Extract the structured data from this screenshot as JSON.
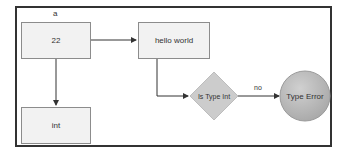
{
  "diagram": {
    "nodes": [
      {
        "id": "a_value",
        "type": "rect",
        "label": "22",
        "caption": "a"
      },
      {
        "id": "hello",
        "type": "rect",
        "label": "hello world"
      },
      {
        "id": "int_box",
        "type": "rect",
        "label": "int"
      },
      {
        "id": "is_type_int",
        "type": "diamond",
        "label": "Is Type Int"
      },
      {
        "id": "type_error",
        "type": "circle",
        "label": "Type Error"
      }
    ],
    "edges": [
      {
        "from": "a_value",
        "to": "hello",
        "label": ""
      },
      {
        "from": "a_value",
        "to": "int_box",
        "label": ""
      },
      {
        "from": "hello",
        "to": "is_type_int",
        "label": ""
      },
      {
        "from": "is_type_int",
        "to": "type_error",
        "label": "no"
      }
    ],
    "colors": {
      "frame_border": "#333333",
      "box_fill": "#f2f2f2",
      "box_border": "#8c8c8c",
      "diamond_fill": "#cccccc",
      "circle_fill": "#b3b3b3",
      "edge": "#333333"
    }
  }
}
